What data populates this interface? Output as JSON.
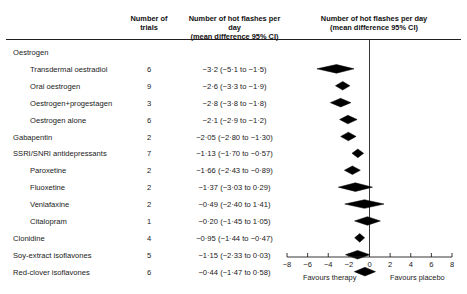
{
  "header": {
    "col_trials": "Number of\ntrials",
    "col_effect": "Number of hot flashes per day\n(mean difference 95% CI)",
    "col_plot": "Number of hot flashes per day\n(mean difference 95% CI)"
  },
  "footer": {
    "left": "Favours therapy",
    "right": "Favours placebo"
  },
  "rows": [
    {
      "label": "Oestrogen",
      "indent": 0,
      "trials": "",
      "effect": ""
    },
    {
      "label": "Transdermal oestradiol",
      "indent": 1,
      "trials": "6",
      "effect": "−3·2 (−5·1 to −1·5)"
    },
    {
      "label": "Oral oestrogen",
      "indent": 1,
      "trials": "9",
      "effect": "−2·6 (−3·3 to −1·9)"
    },
    {
      "label": "Oestrogen+progestagen",
      "indent": 1,
      "trials": "3",
      "effect": "−2·8 (−3·8 to −1·8)"
    },
    {
      "label": "Oestrogen alone",
      "indent": 1,
      "trials": "6",
      "effect": "−2·1 (−2·9 to −1·2)"
    },
    {
      "label": "Gabapentin",
      "indent": 0,
      "trials": "2",
      "effect": "−2·05 (−2·80 to −1·30)"
    },
    {
      "label": "SSRI/SNRI antidepressants",
      "indent": 0,
      "trials": "7",
      "effect": "−1·13 (−1·70 to −0·57)"
    },
    {
      "label": "Paroxetine",
      "indent": 1,
      "trials": "2",
      "effect": "−1·66 (−2·43 to −0·89)"
    },
    {
      "label": "Fluoxetine",
      "indent": 1,
      "trials": "2",
      "effect": "−1·37 (−3·03 to 0·29)"
    },
    {
      "label": "Venlafaxine",
      "indent": 1,
      "trials": "2",
      "effect": "−0·49 (−2·40 to 1·41)"
    },
    {
      "label": "Citalopram",
      "indent": 1,
      "trials": "1",
      "effect": "−0·20 (−1·45 to 1·05)"
    },
    {
      "label": "Clonidine",
      "indent": 0,
      "trials": "4",
      "effect": "−0·95 (−1·44 to −0·47)"
    },
    {
      "label": "Soy-extract isoflavones",
      "indent": 0,
      "trials": "5",
      "effect": "−1·15 (−2·33 to 0·03)"
    },
    {
      "label": "Red-clover isoflavones",
      "indent": 0,
      "trials": "6",
      "effect": "−0·44 (−1·47 to 0·58)"
    }
  ],
  "chart_data": {
    "type": "forest",
    "xlabel": "",
    "ylabel": "",
    "xlim": [
      -8,
      8
    ],
    "xticks": [
      -8,
      -6,
      -4,
      -2,
      0,
      2,
      4,
      6,
      8
    ],
    "xtick_labels": [
      "−8",
      "−6",
      "−4",
      "−2",
      "0",
      "2",
      "4",
      "6",
      "8"
    ],
    "null_line": 0,
    "grid": false,
    "marker": "diamond",
    "favours_left": "Favours therapy",
    "favours_right": "Favours placebo",
    "points": [
      {
        "label": "Oestrogen",
        "trials": null,
        "mean": null,
        "low": null,
        "high": null
      },
      {
        "label": "Transdermal oestradiol",
        "trials": 6,
        "mean": -3.2,
        "low": -5.1,
        "high": -1.5
      },
      {
        "label": "Oral oestrogen",
        "trials": 9,
        "mean": -2.6,
        "low": -3.3,
        "high": -1.9
      },
      {
        "label": "Oestrogen+progestagen",
        "trials": 3,
        "mean": -2.8,
        "low": -3.8,
        "high": -1.8
      },
      {
        "label": "Oestrogen alone",
        "trials": 6,
        "mean": -2.1,
        "low": -2.9,
        "high": -1.2
      },
      {
        "label": "Gabapentin",
        "trials": 2,
        "mean": -2.05,
        "low": -2.8,
        "high": -1.3
      },
      {
        "label": "SSRI/SNRI antidepressants",
        "trials": 7,
        "mean": -1.13,
        "low": -1.7,
        "high": -0.57
      },
      {
        "label": "Paroxetine",
        "trials": 2,
        "mean": -1.66,
        "low": -2.43,
        "high": -0.89
      },
      {
        "label": "Fluoxetine",
        "trials": 2,
        "mean": -1.37,
        "low": -3.03,
        "high": 0.29
      },
      {
        "label": "Venlafaxine",
        "trials": 2,
        "mean": -0.49,
        "low": -2.4,
        "high": 1.41
      },
      {
        "label": "Citalopram",
        "trials": 1,
        "mean": -0.2,
        "low": -1.45,
        "high": 1.05
      },
      {
        "label": "Clonidine",
        "trials": 4,
        "mean": -0.95,
        "low": -1.44,
        "high": -0.47
      },
      {
        "label": "Soy-extract isoflavones",
        "trials": 5,
        "mean": -1.15,
        "low": -2.33,
        "high": 0.03
      },
      {
        "label": "Red-clover isoflavones",
        "trials": 6,
        "mean": -0.44,
        "low": -1.47,
        "high": 0.58
      }
    ]
  },
  "colors": {
    "marker": "#000000",
    "axis": "#231f20",
    "text": "#1a1a1a"
  }
}
